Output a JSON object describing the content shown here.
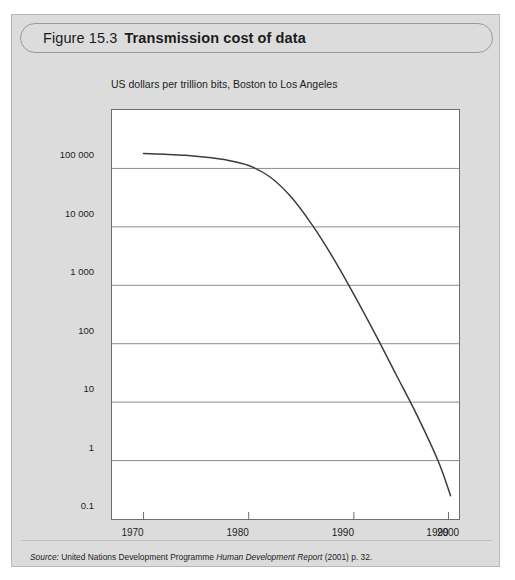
{
  "figure": {
    "number": "Figure 15.3",
    "title": "Transmission cost of data",
    "subtitle": "US dollars per trillion bits, Boston to Los Angeles",
    "source": {
      "label": "Source:",
      "publisher": "United Nations Development Programme",
      "publication": "Human Development Report",
      "citation": "(2001) p. 32."
    }
  },
  "colors": {
    "card_background": "#dcdcdc",
    "card_border": "#b8b8b8",
    "plot_background": "#ffffff",
    "plot_border": "#6e6e6e",
    "gridline": "#8d8d8d",
    "curve": "#3c3c3c",
    "text": "#1d1d1d"
  },
  "chart_data": {
    "type": "line",
    "title": "Transmission cost of data",
    "subtitle": "US dollars per trillion bits, Boston to Los Angeles",
    "xlabel": "",
    "ylabel": "",
    "yscale": "log",
    "ylim": [
      0.1,
      1000000
    ],
    "xlim": [
      1967,
      2000
    ],
    "grid": true,
    "legend": false,
    "y_ticks": [
      {
        "value": 100000,
        "label": "100 000"
      },
      {
        "value": 10000,
        "label": "10 000"
      },
      {
        "value": 1000,
        "label": "1 000"
      },
      {
        "value": 100,
        "label": "100"
      },
      {
        "value": 10,
        "label": "10"
      },
      {
        "value": 1,
        "label": "1"
      },
      {
        "value": 0.1,
        "label": "0.1"
      }
    ],
    "x_ticks": [
      {
        "value": 1970,
        "label": "1970"
      },
      {
        "value": 1980,
        "label": "1980"
      },
      {
        "value": 1990,
        "label": "1990"
      },
      {
        "value": 1999,
        "label": "1999"
      },
      {
        "value": 2000,
        "label": "2000"
      }
    ],
    "series": [
      {
        "name": "Transmission cost",
        "x": [
          1970,
          1972,
          1974,
          1976,
          1978,
          1980,
          1982,
          1984,
          1986,
          1988,
          1990,
          1992,
          1994,
          1996,
          1998,
          1999.2
        ],
        "values": [
          180000,
          175000,
          168000,
          155000,
          138000,
          112000,
          72000,
          33000,
          11000,
          3000,
          700,
          150,
          30,
          6,
          1.0,
          0.25
        ]
      }
    ]
  }
}
